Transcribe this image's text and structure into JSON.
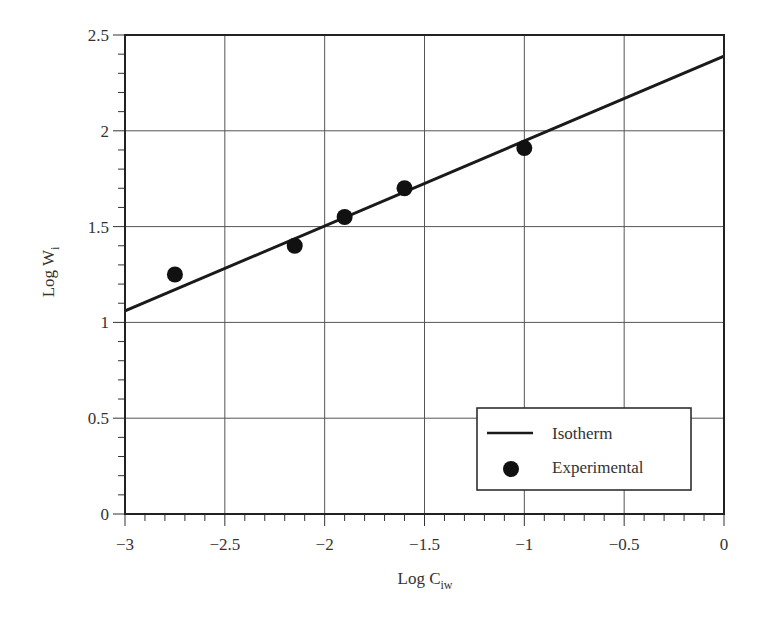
{
  "chart_data": {
    "type": "scatter",
    "title": "",
    "xlabel": "Log C",
    "xlabel_sub": "iw",
    "ylabel": "Log W",
    "ylabel_sub": "i",
    "xlim": [
      -3,
      0
    ],
    "ylim": [
      0,
      2.5
    ],
    "grid": true,
    "x_ticks": [
      -3,
      -2.5,
      -2,
      -1.5,
      -1,
      -0.5,
      0
    ],
    "x_tick_labels": [
      "−3",
      "−2.5",
      "−2",
      "−1.5",
      "−1",
      "−0.5",
      "0"
    ],
    "y_ticks": [
      0,
      0.5,
      1,
      1.5,
      2,
      2.5
    ],
    "y_tick_labels": [
      "0",
      "0.5",
      "1",
      "1.5",
      "2",
      "2.5"
    ],
    "minor_tick_step": 0.1,
    "legend_position": "lower right",
    "series": [
      {
        "name": "Isotherm",
        "type": "line",
        "x": [
          -3,
          0
        ],
        "y": [
          1.06,
          2.39
        ],
        "color": "#1a1a1a"
      },
      {
        "name": "Experimental",
        "type": "scatter",
        "x": [
          -2.75,
          -2.15,
          -1.9,
          -1.6,
          -1.0
        ],
        "y": [
          1.25,
          1.4,
          1.55,
          1.7,
          1.91
        ],
        "color": "#111111"
      }
    ]
  },
  "legend": {
    "items": [
      {
        "label": "Isotherm",
        "symbol": "line"
      },
      {
        "label": "Experimental",
        "symbol": "dot"
      }
    ]
  },
  "colors": {
    "frame": "#222222",
    "grid": "#555555",
    "line": "#1a1a1a",
    "marker": "#111111",
    "background": "#ffffff"
  }
}
